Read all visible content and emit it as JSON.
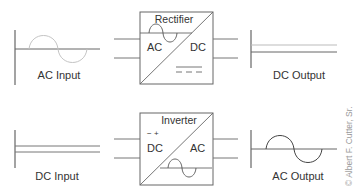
{
  "diagram": {
    "rectifier": {
      "title": "Rectifier",
      "left_label": "AC",
      "right_label": "DC",
      "input_label": "AC Input",
      "output_label": "DC Output"
    },
    "inverter": {
      "title": "Inverter",
      "left_label": "DC",
      "right_label": "AC",
      "polarity_symbol": "− +",
      "input_label": "DC Input",
      "output_label": "AC Output"
    },
    "credit": "© Albert F. Cutter, Sr.",
    "colors": {
      "line": "#555555",
      "light_line": "#b5b5b5",
      "text": "#333333"
    }
  }
}
